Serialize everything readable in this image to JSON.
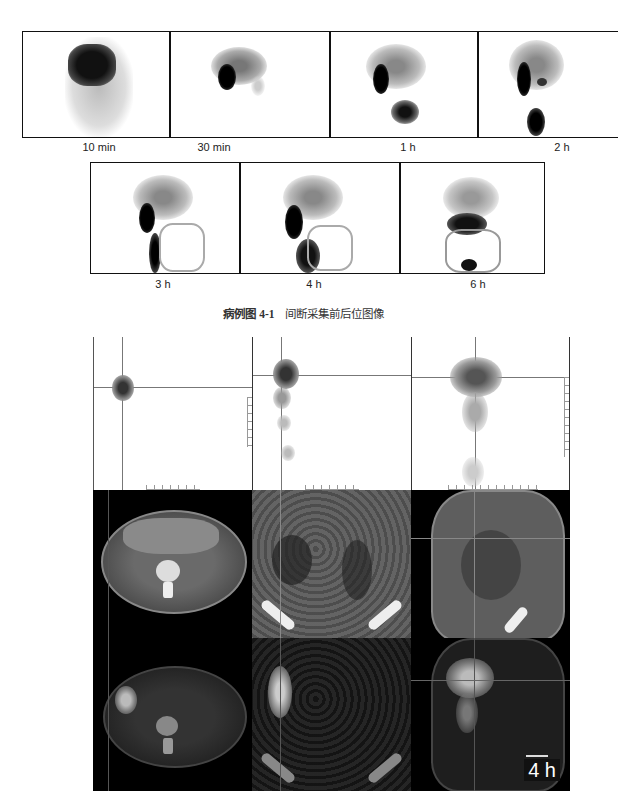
{
  "figure_top": {
    "frames": [
      {
        "label": "10 min"
      },
      {
        "label": "30 min"
      },
      {
        "label": "1 h"
      },
      {
        "label": "2 h"
      },
      {
        "label": "3 h"
      },
      {
        "label": "4 h"
      },
      {
        "label": "6 h"
      }
    ],
    "caption_number": "病例图 4-1",
    "caption_text": "间断采集前后位图像"
  },
  "figure_bottom": {
    "rows": [
      "SPECT MIP",
      "CT",
      "SPECT/CT fusion"
    ],
    "columns": [
      "axial",
      "coronal",
      "sagittal"
    ],
    "time_tag": "4 h"
  }
}
